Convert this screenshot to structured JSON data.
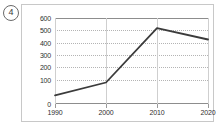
{
  "question_number": "4",
  "chart_data": {
    "type": "line",
    "title": "",
    "xlabel": "",
    "ylabel": "",
    "categories": [
      "1990",
      "2000",
      "2010",
      "2020"
    ],
    "x": [
      1990,
      2000,
      2010,
      2020
    ],
    "values": [
      60,
      150,
      530,
      450
    ],
    "series": [
      {
        "name": "",
        "values": [
          60,
          150,
          530,
          450
        ],
        "color": "#3b3b3b"
      }
    ],
    "ylim": [
      0,
      600
    ],
    "ytick_labels": [
      "0",
      "100",
      "200",
      "300",
      "400",
      "500",
      "600"
    ],
    "yticks": [
      0,
      100,
      200,
      300,
      400,
      500,
      600
    ],
    "xtick_labels": [
      "1990",
      "2000",
      "2010",
      "2020"
    ],
    "grid": true,
    "grid_style": "horizontal dotted, vertical solid",
    "legend": false,
    "markers": false,
    "line_color": "#3b3b3b",
    "grid_color": "#b4b4b4",
    "axis_color": "#8d8d8d",
    "frame_color": "#c8c8c8",
    "background": "#ffffff"
  },
  "footer_scrap": "· · · · · ·"
}
